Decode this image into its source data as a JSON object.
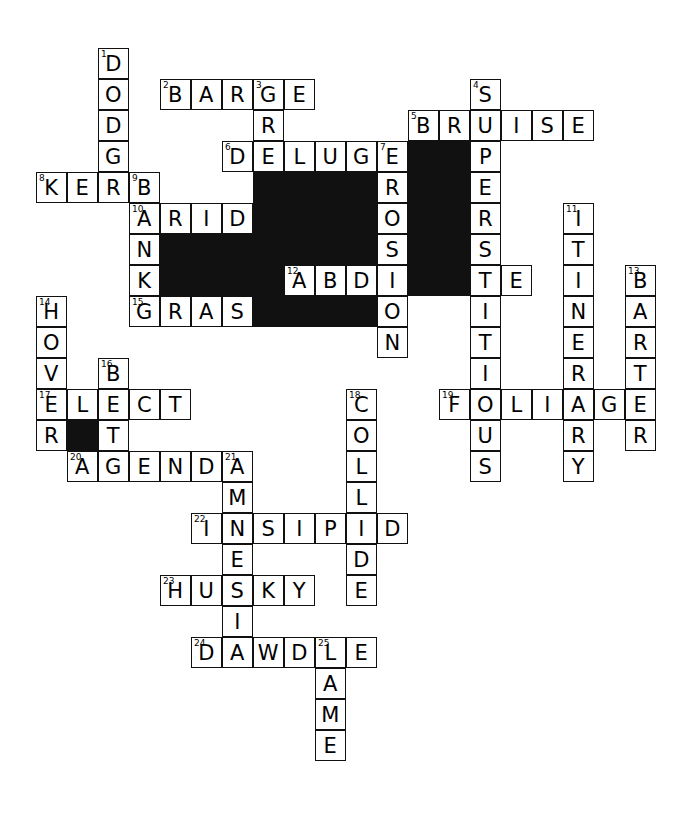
{
  "puzzle": {
    "kind": "crossword-grid",
    "cell_size": 31,
    "origin_x": 36,
    "origin_y": 48,
    "grid_cols": 20,
    "grid_rows": 24,
    "ink_color": "#111111",
    "paper_color": "#ffffff",
    "letter_color": "#000000",
    "entries": [
      {
        "number": 1,
        "direction": "down",
        "answer": "DODGE",
        "row": 0,
        "col": 2
      },
      {
        "number": 2,
        "direction": "across",
        "answer": "BARGE",
        "row": 1,
        "col": 4
      },
      {
        "number": 3,
        "direction": "down",
        "answer": "GREEDY",
        "row": 1,
        "col": 7
      },
      {
        "number": 4,
        "direction": "down",
        "answer": "SUPERSTITIOUS",
        "row": 1,
        "col": 14
      },
      {
        "number": 5,
        "direction": "across",
        "answer": "BRUISE",
        "row": 2,
        "col": 12
      },
      {
        "number": 6,
        "direction": "across",
        "answer": "DELUGE",
        "row": 3,
        "col": 6
      },
      {
        "number": 7,
        "direction": "down",
        "answer": "EROSION",
        "row": 3,
        "col": 11
      },
      {
        "number": 8,
        "direction": "across",
        "answer": "KERB",
        "row": 4,
        "col": 0
      },
      {
        "number": 9,
        "direction": "down",
        "answer": "BANK",
        "row": 4,
        "col": 3
      },
      {
        "number": 10,
        "direction": "across",
        "answer": "ARID",
        "row": 5,
        "col": 3
      },
      {
        "number": 11,
        "direction": "down",
        "answer": "ITINERARY",
        "row": 5,
        "col": 17
      },
      {
        "number": 12,
        "direction": "across",
        "answer": "ABDICATE",
        "row": 7,
        "col": 8
      },
      {
        "number": 13,
        "direction": "down",
        "answer": "BARTER",
        "row": 7,
        "col": 19
      },
      {
        "number": 14,
        "direction": "down",
        "answer": "HOVER",
        "row": 8,
        "col": 0
      },
      {
        "number": 15,
        "direction": "across",
        "answer": "GRASP",
        "row": 8,
        "col": 3
      },
      {
        "number": 16,
        "direction": "down",
        "answer": "BITE",
        "row": 10,
        "col": 2
      },
      {
        "number": 17,
        "direction": "across",
        "answer": "ELECT",
        "row": 11,
        "col": 0
      },
      {
        "number": 18,
        "direction": "down",
        "answer": "COLLIDE",
        "row": 11,
        "col": 10
      },
      {
        "number": 19,
        "direction": "across",
        "answer": "FOLIAGE",
        "row": 11,
        "col": 13
      },
      {
        "number": 20,
        "direction": "across",
        "answer": "AGENDA",
        "row": 13,
        "col": 1
      },
      {
        "number": 21,
        "direction": "down",
        "answer": "AMNESIA",
        "row": 13,
        "col": 6
      },
      {
        "number": 22,
        "direction": "across",
        "answer": "INSIPID",
        "row": 15,
        "col": 5
      },
      {
        "number": 23,
        "direction": "across",
        "answer": "HUSKY",
        "row": 17,
        "col": 4
      },
      {
        "number": 24,
        "direction": "across",
        "answer": "DAWDLE",
        "row": 19,
        "col": 5
      },
      {
        "number": 25,
        "direction": "down",
        "answer": "LAME",
        "row": 19,
        "col": 9
      }
    ],
    "blocks": [
      {
        "row": 3,
        "col": 12
      },
      {
        "row": 3,
        "col": 13
      },
      {
        "row": 4,
        "col": 7
      },
      {
        "row": 4,
        "col": 8
      },
      {
        "row": 4,
        "col": 9
      },
      {
        "row": 4,
        "col": 10
      },
      {
        "row": 4,
        "col": 12
      },
      {
        "row": 4,
        "col": 13
      },
      {
        "row": 5,
        "col": 7
      },
      {
        "row": 5,
        "col": 8
      },
      {
        "row": 5,
        "col": 9
      },
      {
        "row": 5,
        "col": 10
      },
      {
        "row": 5,
        "col": 12
      },
      {
        "row": 5,
        "col": 13
      },
      {
        "row": 6,
        "col": 4
      },
      {
        "row": 6,
        "col": 5
      },
      {
        "row": 6,
        "col": 6
      },
      {
        "row": 6,
        "col": 7
      },
      {
        "row": 6,
        "col": 8
      },
      {
        "row": 6,
        "col": 9
      },
      {
        "row": 6,
        "col": 10
      },
      {
        "row": 6,
        "col": 12
      },
      {
        "row": 6,
        "col": 13
      },
      {
        "row": 7,
        "col": 4
      },
      {
        "row": 7,
        "col": 5
      },
      {
        "row": 7,
        "col": 6
      },
      {
        "row": 7,
        "col": 7
      },
      {
        "row": 7,
        "col": 12
      },
      {
        "row": 7,
        "col": 13
      },
      {
        "row": 8,
        "col": 7
      },
      {
        "row": 8,
        "col": 8
      },
      {
        "row": 8,
        "col": 9
      },
      {
        "row": 8,
        "col": 10
      },
      {
        "row": 12,
        "col": 1
      }
    ]
  }
}
